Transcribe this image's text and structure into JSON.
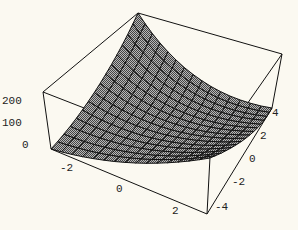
{
  "chart_data": {
    "type": "surface3d",
    "title": "",
    "function_hint": "bowl-shaped surface rising toward back corner",
    "x_axis": {
      "label": "",
      "range": [
        -3,
        3
      ],
      "ticks": [
        "-2",
        "0",
        "2"
      ]
    },
    "y_axis": {
      "label": "",
      "range": [
        -5,
        5
      ],
      "ticks": [
        "-4",
        "-2",
        "0",
        "2",
        "4"
      ]
    },
    "z_axis": {
      "label": "",
      "range": [
        0,
        250
      ],
      "ticks": [
        "0",
        "100",
        "200"
      ]
    },
    "box": true,
    "mesh": true,
    "mesh_lines": 15,
    "colors": {
      "background": "#fbf9f1",
      "surface": "#8a8a8a",
      "mesh": "#111111",
      "box": "#111111"
    }
  },
  "labels": {
    "z": [
      "0",
      "100",
      "200"
    ],
    "x": [
      "-2",
      "0",
      "2"
    ],
    "y": [
      "-4",
      "-2",
      "0",
      "2",
      "4"
    ]
  }
}
